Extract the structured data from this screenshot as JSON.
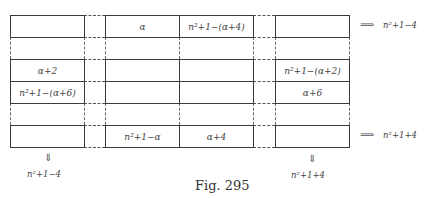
{
  "figure": {
    "caption": "Fig. 295",
    "cells": {
      "r1_mid_left": "α",
      "r1_mid_right": "n²+1−(α+4)",
      "r2_left": "α+2",
      "r2_right": "n²+1−(α+2)",
      "r3_left": "n²+1−(α+6)",
      "r3_right": "α+6",
      "r4_mid_left": "n²+1−α",
      "r4_mid_right": "α+4"
    },
    "row_sums": {
      "top_arrow": "⟹",
      "top": "n²+1−4",
      "bottom_arrow": "⟹",
      "bottom": "n²+1+4"
    },
    "col_sums": {
      "left_arrow": "⇓",
      "left": "n²+1−4",
      "right_arrow": "⇓",
      "right": "n²+1+4"
    }
  }
}
